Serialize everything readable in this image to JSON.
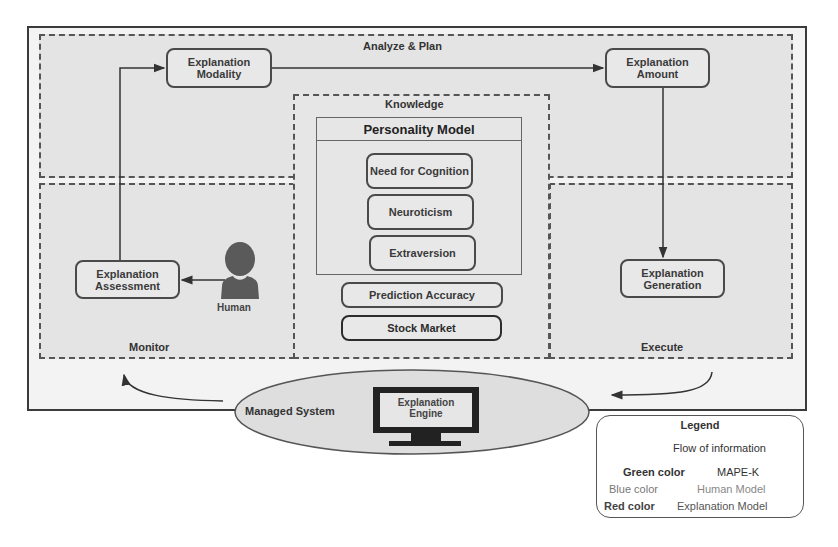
{
  "diagram": {
    "phases": {
      "analyze_plan": "Analyze & Plan",
      "monitor": "Monitor",
      "execute": "Execute",
      "knowledge": "Knowledge"
    },
    "nodes": {
      "explanation_modality": "Explanation Modality",
      "explanation_amount": "Explanation Amount",
      "explanation_assessment": "Explanation Assessment",
      "explanation_generation": "Explanation Generation",
      "prediction_accuracy": "Prediction Accuracy",
      "stock_market": "Stock Market"
    },
    "personality_model": {
      "title": "Personality Model",
      "traits": [
        "Need for Cognition",
        "Neuroticism",
        "Extraversion"
      ]
    },
    "human": {
      "label": "Human",
      "icon": "person-icon"
    },
    "managed_system": {
      "label": "Managed System",
      "engine_label": "Explanation Engine",
      "icon": "monitor-icon"
    },
    "edges": [
      {
        "from": "Explanation Assessment",
        "to": "Explanation Modality"
      },
      {
        "from": "Explanation Modality",
        "to": "Explanation Amount"
      },
      {
        "from": "Explanation Amount",
        "to": "Explanation Generation"
      },
      {
        "from": "Human",
        "to": "Explanation Assessment"
      },
      {
        "from": "Execute",
        "to": "Managed System"
      },
      {
        "from": "Managed System",
        "to": "Monitor"
      }
    ]
  },
  "legend": {
    "title": "Legend",
    "flow_label": "Flow of information",
    "entries": [
      {
        "key": "Green color",
        "value": "MAPE-K"
      },
      {
        "key": "Blue color",
        "value": "Human Model"
      },
      {
        "key": "Red color",
        "value": "Explanation Model"
      }
    ]
  }
}
